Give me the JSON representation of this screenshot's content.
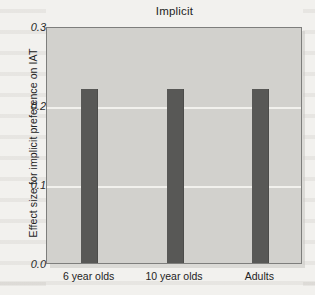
{
  "chart_data": {
    "type": "bar",
    "title": "Implicit",
    "xlabel": "",
    "ylabel": "Effect size for implicit preference on IAT",
    "categories": [
      "6 year olds",
      "10 year olds",
      "Adults"
    ],
    "values": [
      0.22,
      0.22,
      0.22
    ],
    "ylim": [
      0.0,
      0.3
    ],
    "yticks": [
      0.0,
      0.1,
      0.2,
      0.3
    ],
    "ytick_labels": [
      "0.0",
      "0.1",
      "0.2",
      "0.3"
    ],
    "grid": true,
    "gridlines_at": [
      0.1,
      0.2
    ],
    "legend": null,
    "legend_position": "none",
    "series": [
      {
        "name": "Implicit preference",
        "values": [
          0.22,
          0.22,
          0.22
        ]
      }
    ],
    "colors": {
      "bar": "#585856",
      "plot_background": "#d2d1cd",
      "page_background": "#f2f1ee",
      "gridline": "#f4f3f0",
      "axis_border": "#7e7e7c",
      "text": "#232323"
    }
  }
}
